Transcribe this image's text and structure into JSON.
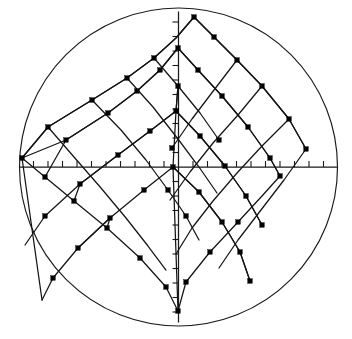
{
  "figure": {
    "title": "",
    "width": 352,
    "height": 339,
    "background_color": "#ffffff",
    "line_color": "#141414",
    "node_color": "#000000"
  },
  "chart_data": {
    "type": "scatter",
    "title": "",
    "subtitle": "",
    "xlabel": "",
    "ylabel": "",
    "xlim": [
      -11,
      11
    ],
    "ylim": [
      -11,
      11
    ],
    "grid": false,
    "legend": null,
    "legend_position": "none",
    "annotations": [],
    "axes": {
      "center_px": [
        178.5,
        167.0
      ],
      "radius_px": 159.0,
      "x_axis": {
        "from_px": [
          19.5,
          167.0
        ],
        "to_px": [
          338.0,
          167.0
        ],
        "tick_spacing_px": 14.5,
        "tick_length_px": 6,
        "tick_side": "above",
        "tick_count_each_side": 10,
        "tick_labels": []
      },
      "y_axis": {
        "from_px": [
          178.5,
          11.5
        ],
        "to_px": [
          178.5,
          322.5
        ],
        "tick_spacing_px": 14.5,
        "tick_length_px": 6,
        "tick_side": "left",
        "tick_count_each_side": 10,
        "tick_labels": []
      }
    },
    "boundary": {
      "shape": "circle",
      "center": [
        0,
        0
      ],
      "radius_px": 159,
      "stroke": "#1a1a1a"
    },
    "series": [
      {
        "name": "grid-family-u",
        "kind": "polyline-family",
        "curves": [
          [
            [
              194,
              17
            ],
            [
              176,
              38
            ],
            [
              154,
              58
            ],
            [
              127,
              78
            ],
            [
              92,
              100
            ],
            [
              48,
              127
            ],
            [
              22,
              158
            ]
          ],
          [
            [
              194,
              17
            ],
            [
              214,
              37
            ],
            [
              237,
              60
            ],
            [
              262,
              86
            ],
            [
              289,
              119
            ],
            [
              306,
              149
            ]
          ],
          [
            [
              178,
              48
            ],
            [
              160,
              70
            ],
            [
              137,
              91
            ],
            [
              108,
              113
            ],
            [
              66,
              140
            ],
            [
              22,
              158
            ]
          ],
          [
            [
              178,
              48
            ],
            [
              198,
              70
            ],
            [
              222,
              96
            ],
            [
              248,
              127
            ],
            [
              270,
              158
            ],
            [
              280,
              176
            ]
          ],
          [
            [
              176,
              111
            ],
            [
              150,
              131
            ],
            [
              118,
              155
            ],
            [
              80,
              184
            ],
            [
              45,
              216
            ],
            [
              25,
              245
            ]
          ],
          [
            [
              176,
              111
            ],
            [
              200,
              136
            ],
            [
              225,
              166
            ],
            [
              246,
              196
            ],
            [
              262,
              225
            ]
          ],
          [
            [
              173,
              167
            ],
            [
              144,
              190
            ],
            [
              110,
              218
            ],
            [
              78,
              248
            ],
            [
              53,
              278
            ],
            [
              42,
              300
            ]
          ],
          [
            [
              173,
              167
            ],
            [
              199,
              192
            ],
            [
              222,
              222
            ],
            [
              240,
              252
            ],
            [
              250,
              281
            ]
          ],
          [
            [
              22,
              158
            ],
            [
              45,
              177
            ],
            [
              74,
              201
            ],
            [
              107,
              228
            ],
            [
              140,
              258
            ],
            [
              166,
              287
            ],
            [
              178,
              311
            ]
          ],
          [
            [
              280,
              176
            ],
            [
              262,
              196
            ],
            [
              238,
              222
            ],
            [
              210,
              252
            ],
            [
              186,
              282
            ],
            [
              178,
              311
            ]
          ]
        ]
      },
      {
        "name": "grid-family-v",
        "kind": "polyline-family",
        "curves": [
          [
            [
              22,
              158
            ],
            [
              48,
              127
            ],
            [
              92,
              100
            ],
            [
              127,
              78
            ],
            [
              154,
              58
            ],
            [
              176,
              38
            ],
            [
              194,
              17
            ]
          ],
          [
            [
              45,
              177
            ],
            [
              66,
              140
            ],
            [
              108,
              113
            ],
            [
              137,
              91
            ],
            [
              160,
              70
            ],
            [
              178,
              48
            ]
          ],
          [
            [
              74,
              201
            ],
            [
              80,
              184
            ],
            [
              118,
              155
            ],
            [
              150,
              131
            ],
            [
              176,
              111
            ],
            [
              178,
              86
            ]
          ],
          [
            [
              107,
              228
            ],
            [
              110,
              218
            ],
            [
              78,
              248
            ]
          ],
          [
            [
              178,
              86
            ],
            [
              176,
              111
            ],
            [
              173,
              167
            ],
            [
              178,
              311
            ]
          ],
          [
            [
              306,
              149
            ],
            [
              289,
              119
            ],
            [
              262,
              86
            ],
            [
              237,
              60
            ],
            [
              214,
              37
            ],
            [
              194,
              17
            ]
          ],
          [
            [
              280,
              176
            ],
            [
              270,
              158
            ],
            [
              248,
              127
            ],
            [
              222,
              96
            ],
            [
              198,
              70
            ],
            [
              178,
              48
            ]
          ],
          [
            [
              262,
              225
            ],
            [
              246,
              196
            ],
            [
              225,
              166
            ],
            [
              200,
              136
            ],
            [
              176,
              111
            ]
          ],
          [
            [
              250,
              281
            ],
            [
              240,
              252
            ],
            [
              222,
              222
            ],
            [
              199,
              192
            ],
            [
              173,
              167
            ]
          ]
        ]
      },
      {
        "name": "grid-family-w",
        "kind": "polyline-family",
        "curves": [
          [
            [
              92,
              100
            ],
            [
              121,
              130
            ],
            [
              146,
              160
            ],
            [
              168,
              190
            ],
            [
              186,
              216
            ],
            [
              199,
              240
            ]
          ],
          [
            [
              48,
              127
            ],
            [
              74,
              157
            ],
            [
              101,
              188
            ],
            [
              126,
              218
            ],
            [
              148,
              246
            ],
            [
              166,
              270
            ]
          ],
          [
            [
              127,
              78
            ],
            [
              153,
              107
            ],
            [
              178,
              139
            ],
            [
              199,
              167
            ],
            [
              217,
              193
            ]
          ],
          [
            [
              154,
              58
            ],
            [
              178,
              86
            ],
            [
              200,
              113
            ],
            [
              219,
              140
            ]
          ],
          [
            [
              22,
              158
            ],
            [
              42,
              300
            ]
          ],
          [
            [
              289,
              119
            ],
            [
              262,
              146
            ],
            [
              237,
              173
            ],
            [
              213,
              201
            ],
            [
              192,
              228
            ],
            [
              176,
              254
            ]
          ],
          [
            [
              262,
              86
            ],
            [
              238,
              115
            ],
            [
              213,
              143
            ],
            [
              190,
              172
            ],
            [
              170,
              200
            ]
          ],
          [
            [
              237,
              60
            ],
            [
              214,
              90
            ],
            [
              192,
              119
            ],
            [
              172,
              148
            ]
          ],
          [
            [
              306,
              149
            ],
            [
              284,
              180
            ],
            [
              261,
              210
            ],
            [
              238,
              240
            ],
            [
              219,
              268
            ]
          ]
        ]
      }
    ],
    "nodes": [
      {
        "id": "n1",
        "x_px": 194,
        "y_px": 17
      },
      {
        "id": "n2",
        "x_px": 178,
        "y_px": 48
      },
      {
        "id": "n3",
        "x_px": 176,
        "y_px": 111
      },
      {
        "id": "n4",
        "x_px": 173,
        "y_px": 167
      },
      {
        "id": "n5",
        "x_px": 154,
        "y_px": 58
      },
      {
        "id": "n6",
        "x_px": 127,
        "y_px": 78
      },
      {
        "id": "n7",
        "x_px": 92,
        "y_px": 100
      },
      {
        "id": "n8",
        "x_px": 48,
        "y_px": 127
      },
      {
        "id": "n9",
        "x_px": 22,
        "y_px": 158
      },
      {
        "id": "n10",
        "x_px": 160,
        "y_px": 70
      },
      {
        "id": "n11",
        "x_px": 137,
        "y_px": 91
      },
      {
        "id": "n12",
        "x_px": 108,
        "y_px": 113
      },
      {
        "id": "n13",
        "x_px": 66,
        "y_px": 140
      },
      {
        "id": "n14",
        "x_px": 150,
        "y_px": 131
      },
      {
        "id": "n15",
        "x_px": 118,
        "y_px": 155
      },
      {
        "id": "n16",
        "x_px": 80,
        "y_px": 184
      },
      {
        "id": "n17",
        "x_px": 45,
        "y_px": 216
      },
      {
        "id": "n18",
        "x_px": 144,
        "y_px": 190
      },
      {
        "id": "n19",
        "x_px": 110,
        "y_px": 218
      },
      {
        "id": "n20",
        "x_px": 78,
        "y_px": 248
      },
      {
        "id": "n21",
        "x_px": 53,
        "y_px": 278
      },
      {
        "id": "n22",
        "x_px": 45,
        "y_px": 177
      },
      {
        "id": "n23",
        "x_px": 74,
        "y_px": 201
      },
      {
        "id": "n24",
        "x_px": 107,
        "y_px": 228
      },
      {
        "id": "n25",
        "x_px": 140,
        "y_px": 258
      },
      {
        "id": "n26",
        "x_px": 166,
        "y_px": 287
      },
      {
        "id": "n27",
        "x_px": 178,
        "y_px": 311
      },
      {
        "id": "n28",
        "x_px": 214,
        "y_px": 37
      },
      {
        "id": "n29",
        "x_px": 237,
        "y_px": 60
      },
      {
        "id": "n30",
        "x_px": 262,
        "y_px": 86
      },
      {
        "id": "n31",
        "x_px": 289,
        "y_px": 119
      },
      {
        "id": "n32",
        "x_px": 306,
        "y_px": 149
      },
      {
        "id": "n33",
        "x_px": 198,
        "y_px": 70
      },
      {
        "id": "n34",
        "x_px": 222,
        "y_px": 96
      },
      {
        "id": "n35",
        "x_px": 248,
        "y_px": 127
      },
      {
        "id": "n36",
        "x_px": 280,
        "y_px": 176
      },
      {
        "id": "n37",
        "x_px": 200,
        "y_px": 136
      },
      {
        "id": "n38",
        "x_px": 225,
        "y_px": 166
      },
      {
        "id": "n39",
        "x_px": 246,
        "y_px": 196
      },
      {
        "id": "n40",
        "x_px": 262,
        "y_px": 225
      },
      {
        "id": "n41",
        "x_px": 199,
        "y_px": 192
      },
      {
        "id": "n42",
        "x_px": 222,
        "y_px": 222
      },
      {
        "id": "n43",
        "x_px": 240,
        "y_px": 252
      },
      {
        "id": "n44",
        "x_px": 250,
        "y_px": 281
      },
      {
        "id": "n45",
        "x_px": 238,
        "y_px": 222
      },
      {
        "id": "n46",
        "x_px": 210,
        "y_px": 252
      },
      {
        "id": "n47",
        "x_px": 186,
        "y_px": 282
      },
      {
        "id": "n48",
        "x_px": 186,
        "y_px": 216
      },
      {
        "id": "n49",
        "x_px": 168,
        "y_px": 190
      },
      {
        "id": "n50",
        "x_px": 178,
        "y_px": 86
      },
      {
        "id": "n51",
        "x_px": 270,
        "y_px": 158
      },
      {
        "id": "n52",
        "x_px": 219,
        "y_px": 140
      },
      {
        "id": "n53",
        "x_px": 172,
        "y_px": 148
      }
    ],
    "node_count": 53,
    "marker": {
      "shape": "square",
      "size_px": 4.6,
      "color": "#000000"
    }
  }
}
